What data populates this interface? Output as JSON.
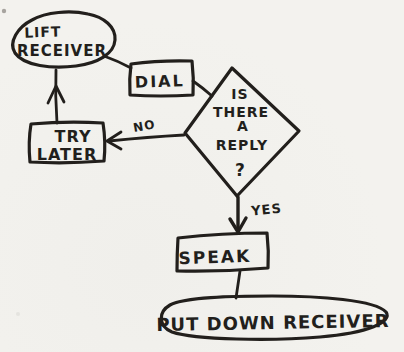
{
  "colors": {
    "ink": "#221f1c",
    "paper": "#f2f1ed"
  },
  "flowchart": {
    "start_terminal": {
      "line1": "LIFT",
      "line2": "RECEIVER"
    },
    "dial_process": {
      "label": "DIAL"
    },
    "reply_decision": {
      "line1": "IS",
      "line2": "THERE",
      "line3": "A",
      "line4": "REPLY",
      "line5": "?"
    },
    "no_branch_label": "NO",
    "try_later_process": {
      "line1": "TRY",
      "line2": "LATER"
    },
    "yes_branch_label": "YES",
    "speak_process": {
      "label": "SPEAK"
    },
    "end_terminal": {
      "label": "PUT DOWN RECEIVER"
    }
  }
}
